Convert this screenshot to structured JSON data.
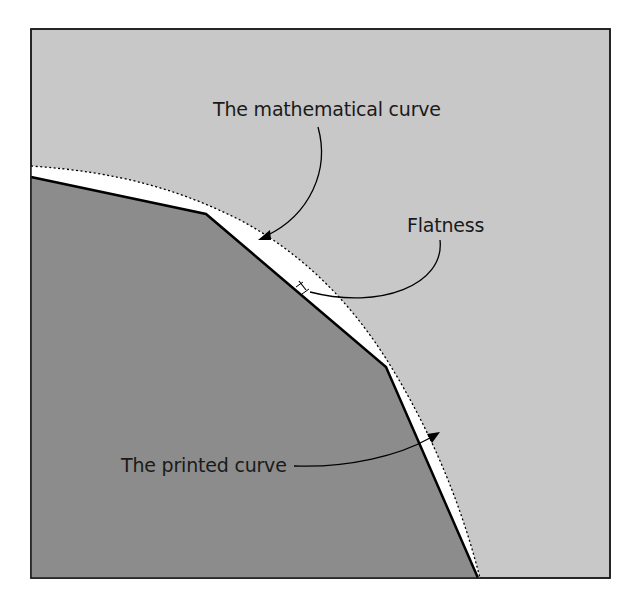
{
  "figure": {
    "colors": {
      "background_region": "#c8c8c8",
      "inner_polygon": "#8c8c8c",
      "gap_fill": "#ffffff",
      "frame_border": "#1a1a1a",
      "printed_curve_stroke": "#000000",
      "mathematical_curve_stroke": "#000000",
      "text": "#1a1a1a"
    },
    "labels": {
      "mathematical_curve": "The mathematical curve",
      "flatness": "Flatness",
      "printed_curve": "The printed curve"
    },
    "printed_curve_vertices": [
      [
        31,
        177
      ],
      [
        206,
        214
      ],
      [
        386,
        367
      ],
      [
        478,
        578
      ]
    ],
    "mathematical_curve_style": "dotted",
    "printed_curve_style": "solid polyline"
  }
}
